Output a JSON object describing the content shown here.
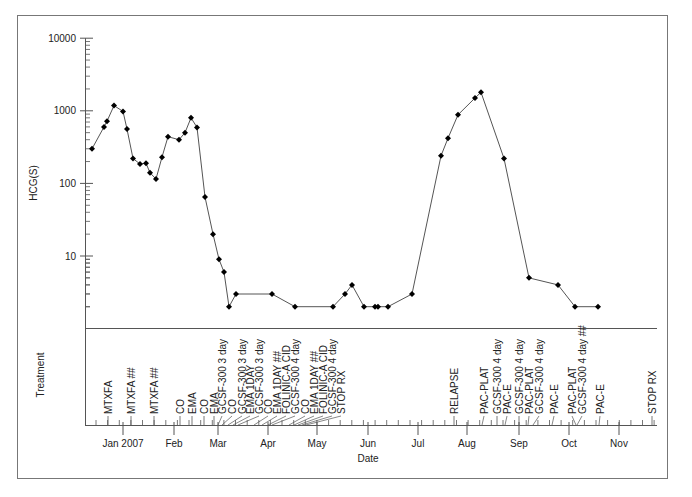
{
  "chart_data": {
    "type": "line",
    "title": "",
    "xlabel": "Date",
    "ylabel": "HCG(S)",
    "yscale": "log",
    "ylim": [
      1,
      10000
    ],
    "yticks": [
      10,
      100,
      1000,
      10000
    ],
    "ytick_labels": [
      "10",
      "100",
      "1000",
      "10000"
    ],
    "grid": false,
    "legend": null,
    "x_month_ticks": [
      {
        "label": "Jan 2007",
        "px": 123
      },
      {
        "label": "Feb",
        "px": 174
      },
      {
        "label": "Mar",
        "px": 218
      },
      {
        "label": "Apr",
        "px": 268
      },
      {
        "label": "May",
        "px": 317
      },
      {
        "label": "Jun",
        "px": 368
      },
      {
        "label": "Jul",
        "px": 418
      },
      {
        "label": "Aug",
        "px": 467
      },
      {
        "label": "Sep",
        "px": 519
      },
      {
        "label": "Oct",
        "px": 569
      },
      {
        "label": "Nov",
        "px": 619
      }
    ],
    "series": [
      {
        "name": "HCG(S)",
        "points": [
          {
            "date": "2006-12-13",
            "px": 92,
            "value": 300
          },
          {
            "date": "2006-12-24",
            "px": 104,
            "value": 600
          },
          {
            "date": "2006-12-27",
            "px": 107,
            "value": 720
          },
          {
            "date": "2007-01-01",
            "px": 114,
            "value": 1180
          },
          {
            "date": "2007-01-06",
            "px": 123,
            "value": 980
          },
          {
            "date": "2007-01-08",
            "px": 127,
            "value": 560
          },
          {
            "date": "2007-01-11",
            "px": 133,
            "value": 220
          },
          {
            "date": "2007-01-15",
            "px": 140,
            "value": 185
          },
          {
            "date": "2007-01-18",
            "px": 146,
            "value": 190
          },
          {
            "date": "2007-01-21",
            "px": 150,
            "value": 140
          },
          {
            "date": "2007-01-25",
            "px": 156,
            "value": 115
          },
          {
            "date": "2007-01-29",
            "px": 162,
            "value": 230
          },
          {
            "date": "2007-02-03",
            "px": 168,
            "value": 440
          },
          {
            "date": "2007-02-13",
            "px": 179,
            "value": 400
          },
          {
            "date": "2007-02-18",
            "px": 185,
            "value": 500
          },
          {
            "date": "2007-02-22",
            "px": 191,
            "value": 800
          },
          {
            "date": "2007-02-26",
            "px": 197,
            "value": 590
          },
          {
            "date": "2007-03-04",
            "px": 205,
            "value": 65
          },
          {
            "date": "2007-03-11",
            "px": 213,
            "value": 20
          },
          {
            "date": "2007-03-15",
            "px": 219,
            "value": 9
          },
          {
            "date": "2007-03-18",
            "px": 224,
            "value": 6
          },
          {
            "date": "2007-03-21",
            "px": 229,
            "value": 2
          },
          {
            "date": "2007-03-25",
            "px": 236,
            "value": 3
          },
          {
            "date": "2007-04-15",
            "px": 272,
            "value": 3
          },
          {
            "date": "2007-04-30",
            "px": 295,
            "value": 2
          },
          {
            "date": "2007-05-22",
            "px": 333,
            "value": 2
          },
          {
            "date": "2007-05-30",
            "px": 345,
            "value": 3
          },
          {
            "date": "2007-06-03",
            "px": 352,
            "value": 4
          },
          {
            "date": "2007-06-09",
            "px": 364,
            "value": 2
          },
          {
            "date": "2007-06-14",
            "px": 375,
            "value": 2
          },
          {
            "date": "2007-06-15",
            "px": 378,
            "value": 2
          },
          {
            "date": "2007-06-18",
            "px": 388,
            "value": 2
          },
          {
            "date": "2007-07-05",
            "px": 412,
            "value": 3
          },
          {
            "date": "2007-07-20",
            "px": 441,
            "value": 240
          },
          {
            "date": "2007-07-24",
            "px": 448,
            "value": 420
          },
          {
            "date": "2007-07-31",
            "px": 458,
            "value": 880
          },
          {
            "date": "2007-08-10",
            "px": 475,
            "value": 1500
          },
          {
            "date": "2007-08-14",
            "px": 481,
            "value": 1800
          },
          {
            "date": "2007-08-31",
            "px": 504,
            "value": 220
          },
          {
            "date": "2007-09-13",
            "px": 529,
            "value": 5
          },
          {
            "date": "2007-09-30",
            "px": 558,
            "value": 4
          },
          {
            "date": "2007-10-09",
            "px": 575,
            "value": 2
          },
          {
            "date": "2007-10-21",
            "px": 598,
            "value": 2
          }
        ]
      }
    ],
    "treatment_panel": {
      "label": "Treatment",
      "events": [
        {
          "label": "MTXFA",
          "tick_px": 108,
          "text_px": 108
        },
        {
          "label": "MTXFA ##",
          "tick_px": 131,
          "text_px": 131
        },
        {
          "label": "MTXFA ##",
          "tick_px": 154,
          "text_px": 154
        },
        {
          "label": "CO",
          "tick_px": 180,
          "text_px": 180
        },
        {
          "label": "EMA",
          "tick_px": 192,
          "text_px": 192
        },
        {
          "label": "CO",
          "tick_px": 204,
          "text_px": 204
        },
        {
          "label": "EMA",
          "tick_px": 214,
          "text_px": 214
        },
        {
          "label": "GCSF-300 3 day",
          "tick_px": 218,
          "text_px": 222
        },
        {
          "label": "CO",
          "tick_px": 222,
          "text_px": 232
        },
        {
          "label": "GCSF-300 3 day",
          "tick_px": 228,
          "text_px": 242
        },
        {
          "label": "EMA 1DAY",
          "tick_px": 233,
          "text_px": 250
        },
        {
          "label": "GCSF-300 3 day",
          "tick_px": 238,
          "text_px": 259
        },
        {
          "label": "CO",
          "tick_px": 254,
          "text_px": 268
        },
        {
          "label": "EMA 1DAY ##",
          "tick_px": 262,
          "text_px": 277
        },
        {
          "label": "FOLINIC-A CID",
          "tick_px": 268,
          "text_px": 286
        },
        {
          "label": "GCSF-300 4 day",
          "tick_px": 272,
          "text_px": 295
        },
        {
          "label": "CO",
          "tick_px": 289,
          "text_px": 305
        },
        {
          "label": "EMA 1DAY ##",
          "tick_px": 294,
          "text_px": 314
        },
        {
          "label": "FOLINIC-A CID",
          "tick_px": 298,
          "text_px": 323
        },
        {
          "label": "GCSF-300 4 day",
          "tick_px": 302,
          "text_px": 332
        },
        {
          "label": "STOP RX",
          "tick_px": 306,
          "text_px": 341
        },
        {
          "label": "RELAPSE",
          "tick_px": 454,
          "text_px": 454
        },
        {
          "label": "PAC-PLAT",
          "tick_px": 482,
          "text_px": 484
        },
        {
          "label": "GCSF-300 4 day",
          "tick_px": 497,
          "text_px": 497
        },
        {
          "label": "PAC-E",
          "tick_px": 505,
          "text_px": 507
        },
        {
          "label": "GCSF-300 4 day",
          "tick_px": 519,
          "text_px": 519
        },
        {
          "label": "PAC-PLAT",
          "tick_px": 528,
          "text_px": 529
        },
        {
          "label": "GCSF-300 4 day",
          "tick_px": 533,
          "text_px": 539
        },
        {
          "label": "PAC-E",
          "tick_px": 552,
          "text_px": 554
        },
        {
          "label": "PAC-PLAT",
          "tick_px": 576,
          "text_px": 572
        },
        {
          "label": "GCSF-300 4 day ##",
          "tick_px": 577,
          "text_px": 582
        },
        {
          "label": "PAC-E",
          "tick_px": 599,
          "text_px": 600
        },
        {
          "label": "STOP RX",
          "tick_px": 652,
          "text_px": 652
        }
      ]
    }
  },
  "colors": {
    "line": "#555555",
    "marker": "#000000",
    "axis": "#555555",
    "frame": "#777777",
    "text": "#222222"
  }
}
